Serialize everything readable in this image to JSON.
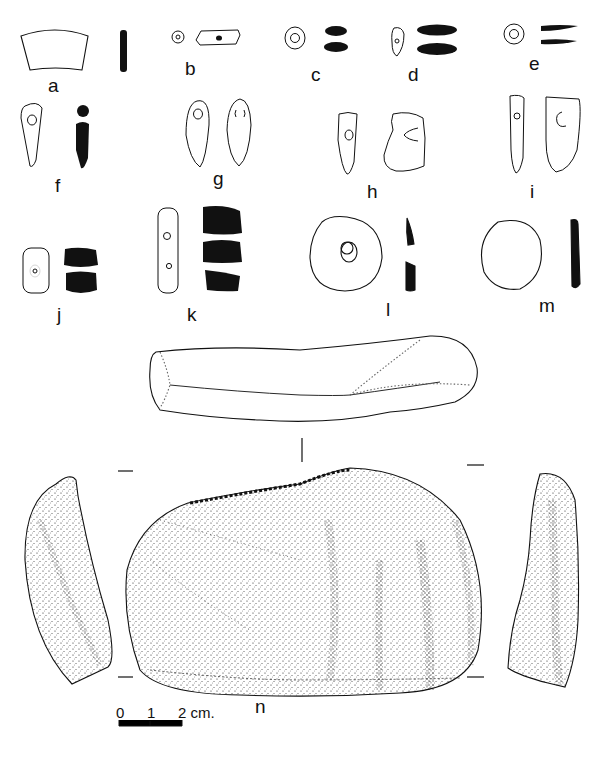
{
  "figure": {
    "type": "archaeological artifact plate (line drawings of stone objects)",
    "ink_color": "#111111",
    "background": "#ffffff"
  },
  "labels": {
    "a": "a",
    "b": "b",
    "c": "c",
    "d": "d",
    "e": "e",
    "f": "f",
    "g": "g",
    "h": "h",
    "i": "i",
    "j": "j",
    "k": "k",
    "l": "l",
    "m": "m",
    "n": "n"
  },
  "scale_bar": {
    "tick_0": "0",
    "tick_1": "1",
    "tick_2": "2 cm."
  }
}
